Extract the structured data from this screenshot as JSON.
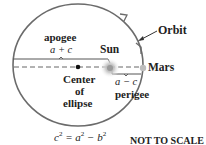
{
  "diagram": {
    "labels": {
      "orbit": "Orbit",
      "apogee": "apogee",
      "apogee_expr": "a + c",
      "sun": "Sun",
      "mars": "Mars",
      "center": "Center",
      "center_of": "of",
      "center_ellipse": "ellipse",
      "perigee_expr": "a − c",
      "perigee": "perigee",
      "formula_lhs": "c",
      "formula_mid": " = a",
      "formula_mid2": " − b",
      "formula_exp": "2",
      "note": "NOT TO SCALE"
    },
    "colors": {
      "orbit_stroke": "#6b6b6b",
      "line": "#555555",
      "sun_glow": "#bbbbbb",
      "mars": "#bdbdbd",
      "text": "#222222"
    }
  }
}
